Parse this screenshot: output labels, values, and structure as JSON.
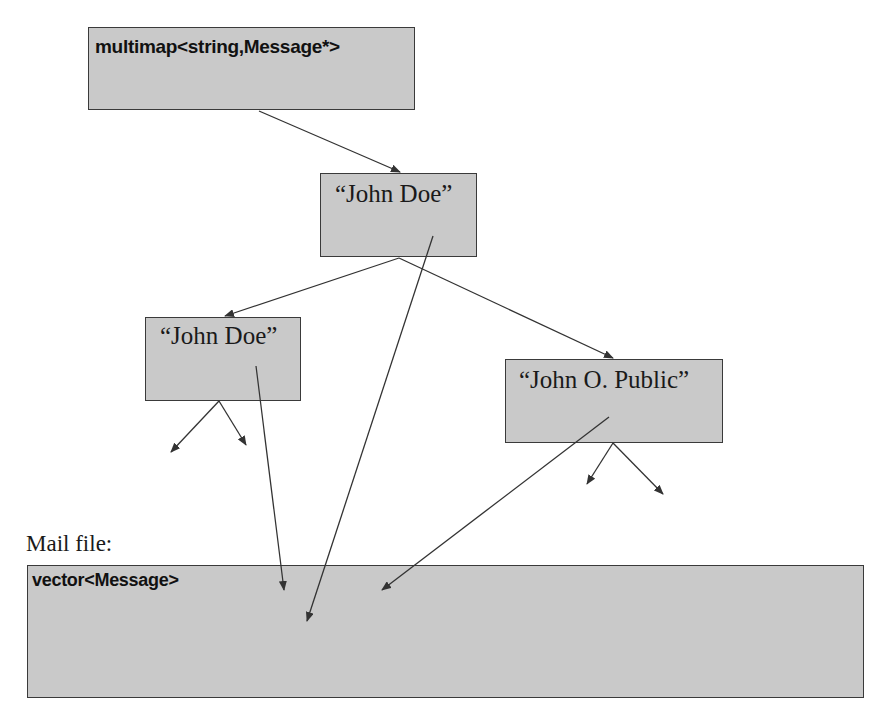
{
  "diagram": {
    "root_container": {
      "label": "multimap<string,Message*>"
    },
    "nodes": [
      {
        "id": "root",
        "label": "“John Doe”"
      },
      {
        "id": "left",
        "label": "“John Doe”"
      },
      {
        "id": "right",
        "label": "“John O. Public”"
      }
    ],
    "mail_file_label": "Mail file:",
    "vector_container": {
      "label": "vector<Message>"
    },
    "colors": {
      "box_fill": "#c9c9c9",
      "border": "#3a3a3a",
      "arrow": "#333333"
    }
  }
}
